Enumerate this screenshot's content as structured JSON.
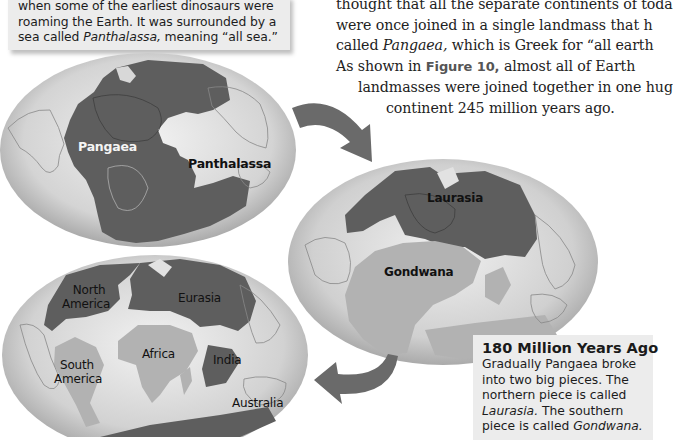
{
  "caption_box": {
    "lines": [
      "when some of the earliest dinosaurs were",
      "roaming the Earth. It was surrounded by a",
      "sea called "
    ],
    "sea_name": "Panthalassa,",
    "tail": " meaning “all sea.”"
  },
  "body_text": {
    "line1": "thought that all the separate continents of toda",
    "line2": "were once joined in a single landmass that h",
    "line3_pre": "called ",
    "line3_italic": "Pangaea,",
    "line3_post": " which is Greek for “all earth",
    "line4_pre": "As shown in ",
    "line4_ref": "Figure 10,",
    "line4_post": " almost all of Earth",
    "line5": "landmasses were joined together in one hug",
    "line6": "continent 245 million years ago."
  },
  "globes": {
    "pangaea": {
      "labels": {
        "landmass": "Pangaea",
        "ocean": "Panthalassa"
      }
    },
    "laurasia_gondwana": {
      "labels": {
        "north": "Laurasia",
        "south": "Gondwana"
      }
    },
    "modern": {
      "labels": {
        "north_america_1": "North",
        "north_america_2": "America",
        "eurasia": "Eurasia",
        "south_america_1": "South",
        "south_america_2": "America",
        "africa": "Africa",
        "india": "India",
        "australia": "Australia"
      }
    }
  },
  "info_box": {
    "title": "180 Million Years Ago",
    "line1": "Gradually Pangaea broke",
    "line2": "into two big pieces. The",
    "line3": "northern piece is called",
    "line4_italic": "Laurasia.",
    "line4_post": " The southern",
    "line5_pre": "piece is called ",
    "line5_italic": "Gondwana."
  },
  "colors": {
    "ocean_light": "#e6e6e6",
    "ocean_mid": "#bdbdbd",
    "land_dark": "#5e5e5e",
    "land_light": "#b2b2b2",
    "arrow": "#6a6a6a",
    "box_bg": "#ececec"
  }
}
